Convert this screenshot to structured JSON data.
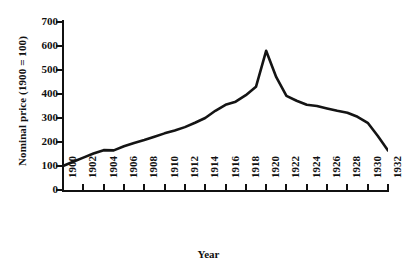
{
  "chart_data": {
    "type": "line",
    "title": "",
    "xlabel": "Year",
    "ylabel": "Nominal price (1900 = 100)",
    "xlim": [
      1900,
      1932
    ],
    "ylim": [
      0,
      700
    ],
    "grid": false,
    "legend": false,
    "line_color": "#141414",
    "x_tick_labels": [
      "1900",
      "1902",
      "1904",
      "1906",
      "1908",
      "1910",
      "1912",
      "1914",
      "1916",
      "1918",
      "1920",
      "1922",
      "1924",
      "1926",
      "1928",
      "1930",
      "1932"
    ],
    "y_tick_labels": [
      "0",
      "100",
      "200",
      "300",
      "400",
      "500",
      "600",
      "700"
    ],
    "y_ticks": [
      0,
      100,
      200,
      300,
      400,
      500,
      600,
      700
    ],
    "series": [
      {
        "name": "Nominal price",
        "x": [
          1900,
          1901,
          1902,
          1903,
          1904,
          1905,
          1906,
          1907,
          1908,
          1909,
          1910,
          1911,
          1912,
          1913,
          1914,
          1915,
          1916,
          1917,
          1918,
          1919,
          1920,
          1921,
          1922,
          1923,
          1924,
          1925,
          1926,
          1927,
          1928,
          1929,
          1930,
          1931,
          1932
        ],
        "values": [
          100,
          118,
          135,
          152,
          166,
          165,
          182,
          196,
          208,
          222,
          236,
          248,
          262,
          280,
          300,
          330,
          355,
          368,
          395,
          430,
          580,
          470,
          392,
          372,
          355,
          350,
          340,
          330,
          322,
          305,
          280,
          225,
          165
        ]
      }
    ]
  },
  "axis": {
    "y_title": "Nominal price (1900 = 100)",
    "x_title": "Year"
  }
}
